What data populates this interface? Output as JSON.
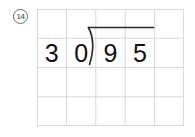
{
  "worksheet": {
    "problem_number_label": "14",
    "problem_number_icon": "circled-number-icon",
    "grid": {
      "columns": 5,
      "rows": 4,
      "line_color": "#d4d4d4",
      "cell_width": 29.4,
      "cell_height": 29.25
    },
    "division": {
      "notation": "long-division",
      "divisor_digits": [
        "3",
        "0"
      ],
      "dividend_digits": [
        "9",
        "5"
      ],
      "quotient_digits": [],
      "expression_text": "30)95",
      "divisor": "30",
      "dividend": "95",
      "bracket_icon": "division-bracket-icon",
      "vinculum_icon": "division-vinculum-icon",
      "ink_color": "#111111",
      "rule_color": "#3a3a3a"
    }
  }
}
